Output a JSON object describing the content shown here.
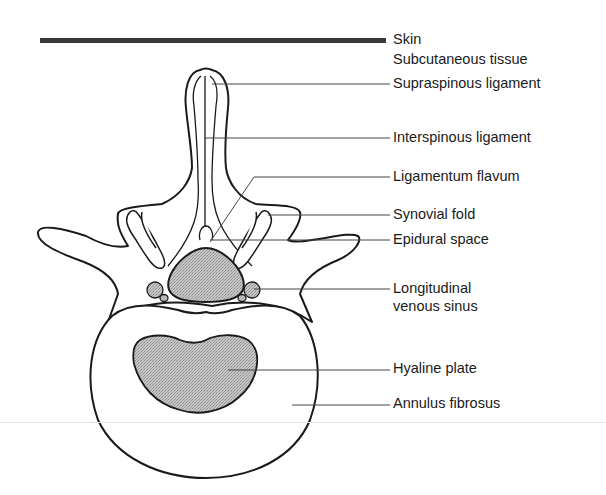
{
  "figure": {
    "colors": {
      "ink": "#1a1a1a",
      "leader": "#444444",
      "stipple_fill": "#b4b4b4",
      "skin_band": "#3a3a3a",
      "background": "#ffffff"
    }
  },
  "labels": [
    {
      "id": "skin",
      "text": "Skin",
      "x": 393,
      "y": 31
    },
    {
      "id": "subcutaneous-tissue",
      "text": "Subcutaneous tissue",
      "x": 393,
      "y": 51
    },
    {
      "id": "supraspinous-ligament",
      "text": "Supraspinous ligament",
      "x": 393,
      "y": 75
    },
    {
      "id": "interspinous-ligament",
      "text": "Interspinous ligament",
      "x": 393,
      "y": 129
    },
    {
      "id": "ligamentum-flavum",
      "text": "Ligamentum flavum",
      "x": 393,
      "y": 168
    },
    {
      "id": "synovial-fold",
      "text": "Synovial fold",
      "x": 393,
      "y": 206
    },
    {
      "id": "epidural-space",
      "text": "Epidural space",
      "x": 393,
      "y": 231
    },
    {
      "id": "longitudinal-venous-sinus-line1",
      "text": "Longitudinal",
      "x": 393,
      "y": 280
    },
    {
      "id": "longitudinal-venous-sinus-line2",
      "text": "venous sinus",
      "x": 393,
      "y": 298
    },
    {
      "id": "hyaline-plate",
      "text": "Hyaline plate",
      "x": 393,
      "y": 360
    },
    {
      "id": "annulus-fibrosus",
      "text": "Annulus fibrosus",
      "x": 393,
      "y": 395
    }
  ]
}
